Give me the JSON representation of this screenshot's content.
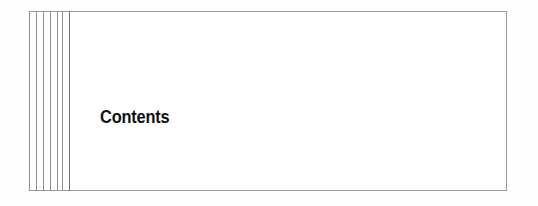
{
  "page": {
    "kind": "book-contents-divider-scan",
    "heading": "Contents",
    "background_color": "#fefefe",
    "paper_color": "#ffffff",
    "frame_color": "#9a9a9a",
    "rule_color": "#8f8f8f",
    "boundary_rule_color": "#6e6e6e",
    "heading_color": "#111111"
  },
  "frame": {
    "label": "page-border",
    "left": 29,
    "top": 11,
    "width": 478,
    "height": 180
  },
  "spine": {
    "label": "decorative-vertical-rules",
    "rule_count": 6,
    "rule_offsets": [
      0,
      7,
      14,
      21,
      28,
      33
    ],
    "boundary_offset": 40
  }
}
